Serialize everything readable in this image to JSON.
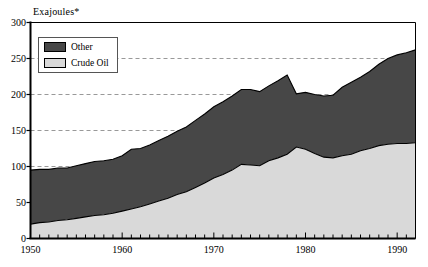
{
  "chart_data": {
    "type": "area",
    "title": "Exajoules*",
    "xlabel": "",
    "ylabel": "Exajoules*",
    "stacked": true,
    "grid": true,
    "grid_style": "dashed-horizontal",
    "legend_position": "top-left-inside",
    "xlim": [
      1950,
      1992
    ],
    "ylim": [
      0,
      300
    ],
    "yticks": [
      0,
      50,
      100,
      150,
      200,
      250,
      300
    ],
    "ytick_labels": [
      "0",
      "50",
      "100",
      "150",
      "200",
      "250",
      "300"
    ],
    "xticks": [
      1950,
      1960,
      1970,
      1980,
      1990
    ],
    "xtick_labels": [
      "1950",
      "1960",
      "1970",
      "1980",
      "1990"
    ],
    "xtick_minor_step": 1,
    "colors": {
      "other": "#474747",
      "crude_oil": "#d9d9d9",
      "axis": "#000000",
      "grid": "#999999",
      "outline": "#000000"
    },
    "x": [
      1950,
      1951,
      1952,
      1953,
      1954,
      1955,
      1956,
      1957,
      1958,
      1959,
      1960,
      1961,
      1962,
      1963,
      1964,
      1965,
      1966,
      1967,
      1968,
      1969,
      1970,
      1971,
      1972,
      1973,
      1974,
      1975,
      1976,
      1977,
      1978,
      1979,
      1980,
      1981,
      1982,
      1983,
      1984,
      1985,
      1986,
      1987,
      1988,
      1989,
      1990,
      1991,
      1992
    ],
    "series": [
      {
        "name": "Crude Oil",
        "color": "#d9d9d9",
        "values": [
          20,
          22,
          23,
          25,
          26,
          28,
          30,
          32,
          33,
          35,
          38,
          41,
          44,
          48,
          52,
          56,
          61,
          65,
          71,
          77,
          84,
          89,
          95,
          103,
          102,
          101,
          108,
          112,
          117,
          127,
          124,
          118,
          113,
          112,
          115,
          117,
          122,
          125,
          129,
          131,
          132,
          132,
          133
        ]
      },
      {
        "name": "Other",
        "color": "#474747",
        "values": [
          75,
          74,
          73,
          73,
          72,
          73,
          74,
          75,
          75,
          75,
          77,
          83,
          81,
          82,
          84,
          86,
          88,
          90,
          93,
          96,
          99,
          101,
          103,
          104,
          105,
          103,
          104,
          107,
          110,
          74,
          79,
          82,
          85,
          87,
          95,
          100,
          102,
          107,
          113,
          119,
          123,
          126,
          129
        ]
      }
    ],
    "totals": [
      95,
      96,
      96,
      98,
      98,
      101,
      104,
      107,
      108,
      110,
      115,
      124,
      125,
      130,
      136,
      142,
      149,
      155,
      164,
      173,
      183,
      190,
      198,
      207,
      207,
      204,
      212,
      219,
      227,
      201,
      203,
      200,
      198,
      199,
      210,
      217,
      224,
      232,
      242,
      250,
      255,
      258,
      262
    ],
    "legend": [
      {
        "label": "Other",
        "color": "#474747"
      },
      {
        "label": "Crude Oil",
        "color": "#d9d9d9"
      }
    ]
  }
}
